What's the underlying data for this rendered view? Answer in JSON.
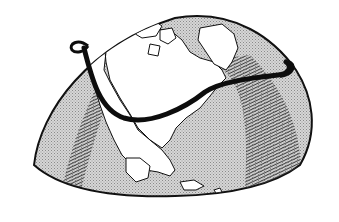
{
  "illustration": {
    "subject": "Globe showing North America with a curved route line",
    "colors": {
      "background": "#ffffff",
      "ocean": "#c9c9c9",
      "land": "#ffffff",
      "outline": "#1a1a1a",
      "route": "#0d0d0d",
      "hatch": "#3a3a3a"
    },
    "elements": [
      "globe",
      "north-america",
      "greenland",
      "arctic-islands",
      "caribbean-islands",
      "night-shading-west",
      "night-shading-east",
      "route-line"
    ]
  }
}
